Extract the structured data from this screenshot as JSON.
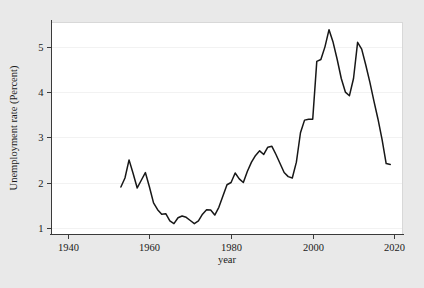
{
  "figure": {
    "background_color": "#e9e9e9",
    "plot_background_color": "#ffffff",
    "line_color": "#171717",
    "grid_color": "#f2f2f2",
    "axis_color": "#3a3a3a"
  },
  "axis_titles": {
    "x": "year",
    "y": "Unemployment rate (Percent)"
  },
  "ticks": {
    "x_labels": [
      "1940",
      "1960",
      "1980",
      "2000",
      "2020"
    ],
    "y_labels": [
      "1",
      "2",
      "3",
      "4",
      "5"
    ]
  },
  "chart_data": {
    "type": "line",
    "title": "",
    "xlabel": "year",
    "ylabel": "Unemployment rate (Percent)",
    "xlim": [
      1936,
      2022
    ],
    "ylim": [
      0.85,
      5.55
    ],
    "xticks": [
      1940,
      1960,
      1980,
      2000,
      2020
    ],
    "yticks": [
      1,
      2,
      3,
      4,
      5
    ],
    "grid": "y-only",
    "legend": "none",
    "series": [
      {
        "name": "Unemployment rate (Percent)",
        "x": [
          1953,
          1954,
          1955,
          1956,
          1957,
          1958,
          1959,
          1960,
          1961,
          1962,
          1963,
          1964,
          1965,
          1966,
          1967,
          1968,
          1969,
          1970,
          1971,
          1972,
          1973,
          1974,
          1975,
          1976,
          1977,
          1978,
          1979,
          1980,
          1981,
          1982,
          1983,
          1984,
          1985,
          1986,
          1987,
          1988,
          1989,
          1990,
          1991,
          1992,
          1993,
          1994,
          1995,
          1996,
          1997,
          1998,
          1999,
          2000,
          2001,
          2002,
          2003,
          2004,
          2005,
          2006,
          2007,
          2008,
          2009,
          2010,
          2011,
          2012,
          2013,
          2014,
          2015,
          2016,
          2017,
          2018,
          2019
        ],
        "y": [
          1.9,
          2.1,
          2.5,
          2.2,
          1.88,
          2.05,
          2.22,
          1.9,
          1.55,
          1.4,
          1.3,
          1.31,
          1.15,
          1.09,
          1.22,
          1.26,
          1.23,
          1.16,
          1.09,
          1.15,
          1.3,
          1.4,
          1.39,
          1.28,
          1.45,
          1.7,
          1.95,
          2.0,
          2.21,
          2.08,
          2.0,
          2.25,
          2.45,
          2.6,
          2.7,
          2.62,
          2.78,
          2.8,
          2.62,
          2.42,
          2.22,
          2.13,
          2.1,
          2.45,
          3.1,
          3.38,
          3.4,
          3.4,
          4.68,
          4.72,
          5.0,
          5.38,
          5.1,
          4.72,
          4.3,
          4.0,
          3.92,
          4.3,
          5.1,
          4.95,
          4.6,
          4.22,
          3.8,
          3.4,
          2.95,
          2.42,
          2.4
        ]
      }
    ]
  }
}
